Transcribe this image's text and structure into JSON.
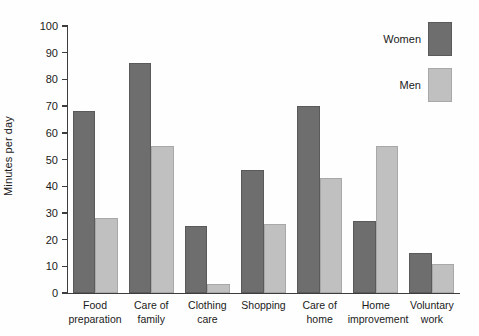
{
  "chart_data": {
    "type": "bar",
    "title": "",
    "xlabel": "",
    "ylabel": "Minutes per day",
    "ylim": [
      0,
      100
    ],
    "ytick_values": [
      0,
      10,
      20,
      30,
      40,
      50,
      60,
      70,
      80,
      90,
      100
    ],
    "ytick_labels": [
      "0",
      "10",
      "20",
      "30",
      "40",
      "50",
      "60",
      "70",
      "80",
      "90",
      "100"
    ],
    "grid": false,
    "legend_position": "top-right",
    "categories": [
      "Food\npreparation",
      "Care of\nfamily",
      "Clothing\ncare",
      "Shopping",
      "Care of\nhome",
      "Home\nimprovement",
      "Voluntary\nwork"
    ],
    "series": [
      {
        "name": "Women",
        "color": "#6e6e6e",
        "values": [
          68,
          86,
          25,
          46,
          70,
          27,
          15
        ]
      },
      {
        "name": "Men",
        "color": "#c0c0c0",
        "values": [
          28,
          55,
          3.5,
          26,
          43,
          55,
          11
        ]
      }
    ]
  },
  "legend": {
    "entries": [
      {
        "label": "Women",
        "swatch": "women"
      },
      {
        "label": "Men",
        "swatch": "men"
      }
    ]
  }
}
